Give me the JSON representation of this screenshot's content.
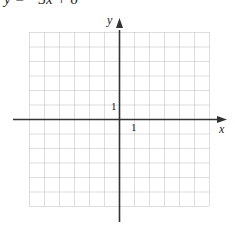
{
  "equation": "y = −3x + 6",
  "graph": {
    "x_axis_label": "x",
    "y_axis_label": "y",
    "x_tick_label": "1",
    "y_tick_label": "1",
    "grid": {
      "columns": 12,
      "rows": 12,
      "xmin": -6,
      "xmax": 6,
      "ymin": -6,
      "ymax": 6
    },
    "colors": {
      "axis": "#333333",
      "grid": "#bbbbbb"
    }
  }
}
